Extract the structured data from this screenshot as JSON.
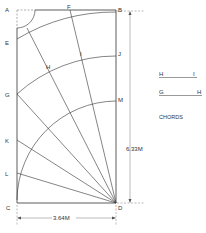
{
  "diagram": {
    "point_labels": {
      "A": "A",
      "B": "B",
      "C": "C",
      "D": "D",
      "E": "E",
      "F": "F",
      "G": "G",
      "H": "H",
      "I": "I",
      "J": "J",
      "K": "K",
      "L": "L",
      "M": "M"
    },
    "dimensions": {
      "width": "3.64M",
      "height": "6.33M"
    },
    "legend": {
      "chord1": {
        "start": "H",
        "end": "I"
      },
      "chord2": {
        "start": "G",
        "end": "H"
      },
      "title": "CHORDS"
    },
    "colors": {
      "line": "#333333",
      "dash": "#999999"
    }
  }
}
